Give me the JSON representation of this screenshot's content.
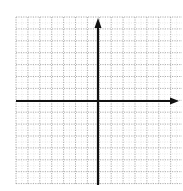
{
  "diagram": {
    "type": "coordinate-plane",
    "grid": {
      "x_start": 16,
      "y_start": 17,
      "x_end": 182,
      "y_end": 185,
      "spacing": 11.9,
      "columns": 14,
      "rows": 14,
      "line_color": "#9a9a9a",
      "line_style": "dotted"
    },
    "axes": {
      "color": "#111111",
      "x_axis_y": 101,
      "y_axis_x": 98,
      "x_axis_arrow": "right",
      "y_axis_arrow": "up",
      "labels": []
    }
  }
}
